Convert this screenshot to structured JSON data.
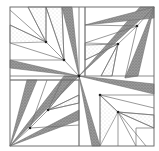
{
  "figure": {
    "width": 159,
    "height": 151,
    "background": "#ffffff",
    "line_color": "#6f6f6f",
    "dark_fill": "#8c8c8c",
    "light_fill": "#d9d9d9",
    "dot_color": "#222222",
    "outer": {
      "x": 10,
      "y": 7,
      "w": 144,
      "h": 139
    },
    "center": {
      "x": 79,
      "y": 76
    }
  },
  "quadrants": [
    {
      "name": "top-left",
      "dark": [
        [
          [
            62,
            7
          ],
          [
            79,
            76
          ],
          [
            72,
            7
          ]
        ],
        [
          [
            10,
            60
          ],
          [
            79,
            76
          ],
          [
            10,
            68
          ]
        ]
      ],
      "spokes": [
        [
          [
            10,
            10
          ],
          [
            46,
            42
          ]
        ],
        [
          [
            28,
            7
          ],
          [
            46,
            42
          ]
        ],
        [
          [
            46,
            7
          ],
          [
            46,
            42
          ]
        ],
        [
          [
            10,
            25
          ],
          [
            46,
            42
          ]
        ],
        [
          [
            10,
            43
          ],
          [
            64,
            60
          ]
        ],
        [
          [
            46,
            7
          ],
          [
            64,
            60
          ]
        ],
        [
          [
            62,
            7
          ],
          [
            64,
            60
          ]
        ],
        [
          [
            46,
            42
          ],
          [
            64,
            60
          ]
        ],
        [
          [
            10,
            60
          ],
          [
            64,
            60
          ]
        ],
        [
          [
            64,
            60
          ],
          [
            79,
            76
          ]
        ]
      ],
      "light": [
        [
          [
            28,
            7
          ],
          [
            46,
            42
          ],
          [
            46,
            7
          ]
        ],
        [
          [
            46,
            7
          ],
          [
            64,
            60
          ],
          [
            62,
            7
          ]
        ],
        [
          [
            10,
            25
          ],
          [
            46,
            42
          ],
          [
            10,
            43
          ]
        ]
      ],
      "dots": [
        [
          46,
          42
        ],
        [
          64,
          60
        ]
      ]
    },
    {
      "name": "top-right",
      "dark": [
        [
          [
            154,
            7
          ],
          [
            79,
            76
          ],
          [
            140,
            7
          ]
        ],
        [
          [
            154,
            7
          ],
          [
            85,
            25
          ],
          [
            154,
            18
          ]
        ],
        [
          [
            154,
            7
          ],
          [
            125,
            78
          ],
          [
            138,
            76
          ]
        ]
      ],
      "spokes": [
        [
          [
            154,
            7
          ],
          [
            137,
            26
          ]
        ],
        [
          [
            137,
            26
          ],
          [
            85,
            25
          ]
        ],
        [
          [
            137,
            26
          ],
          [
            85,
            43
          ]
        ],
        [
          [
            137,
            26
          ],
          [
            118,
            44
          ]
        ],
        [
          [
            118,
            44
          ],
          [
            85,
            45
          ]
        ],
        [
          [
            118,
            44
          ],
          [
            85,
            60
          ]
        ],
        [
          [
            118,
            44
          ],
          [
            101,
            76
          ]
        ],
        [
          [
            118,
            44
          ],
          [
            112,
            76
          ]
        ],
        [
          [
            85,
            7
          ],
          [
            85,
            76
          ]
        ],
        [
          [
            137,
            26
          ],
          [
            125,
            78
          ]
        ]
      ],
      "light": [
        [
          [
            85,
            43
          ],
          [
            118,
            44
          ],
          [
            85,
            60
          ]
        ],
        [
          [
            118,
            44
          ],
          [
            101,
            76
          ],
          [
            112,
            76
          ]
        ]
      ],
      "dots": [
        [
          137,
          26
        ],
        [
          118,
          44
        ]
      ]
    },
    {
      "name": "bottom-left",
      "dark": [
        [
          [
            10,
            146
          ],
          [
            27,
            80
          ],
          [
            37,
            80
          ]
        ],
        [
          [
            10,
            146
          ],
          [
            79,
            120
          ],
          [
            79,
            110
          ]
        ],
        [
          [
            10,
            146
          ],
          [
            79,
            76
          ],
          [
            64,
            76
          ]
        ]
      ],
      "spokes": [
        [
          [
            10,
            146
          ],
          [
            30,
            128
          ]
        ],
        [
          [
            30,
            128
          ],
          [
            47,
            80
          ]
        ],
        [
          [
            30,
            128
          ],
          [
            48,
            110
          ]
        ],
        [
          [
            30,
            128
          ],
          [
            79,
            125
          ]
        ],
        [
          [
            48,
            110
          ],
          [
            62,
            80
          ]
        ],
        [
          [
            48,
            110
          ],
          [
            72,
            80
          ]
        ],
        [
          [
            48,
            110
          ],
          [
            79,
            95
          ]
        ],
        [
          [
            48,
            110
          ],
          [
            79,
            103
          ]
        ],
        [
          [
            10,
            80
          ],
          [
            79,
            80
          ]
        ],
        [
          [
            79,
            80
          ],
          [
            79,
            146
          ]
        ]
      ],
      "light": [
        [
          [
            48,
            110
          ],
          [
            62,
            80
          ],
          [
            72,
            80
          ]
        ],
        [
          [
            48,
            110
          ],
          [
            79,
            95
          ],
          [
            79,
            103
          ]
        ]
      ],
      "dots": [
        [
          30,
          128
        ],
        [
          48,
          110
        ]
      ]
    },
    {
      "name": "bottom-right",
      "dark": [
        [
          [
            79,
            76
          ],
          [
            154,
            94
          ],
          [
            154,
            84
          ]
        ],
        [
          [
            79,
            76
          ],
          [
            100,
            146
          ],
          [
            92,
            146
          ]
        ]
      ],
      "spokes": [
        [
          [
            100,
            95
          ],
          [
            154,
            95
          ]
        ],
        [
          [
            100,
            95
          ],
          [
            154,
            108
          ]
        ],
        [
          [
            100,
            95
          ],
          [
            118,
            112
          ]
        ],
        [
          [
            118,
            112
          ],
          [
            154,
            115
          ]
        ],
        [
          [
            118,
            112
          ],
          [
            154,
            128
          ]
        ],
        [
          [
            118,
            112
          ],
          [
            136,
            146
          ]
        ],
        [
          [
            118,
            112
          ],
          [
            146,
            146
          ]
        ],
        [
          [
            100,
            95
          ],
          [
            100,
            146
          ]
        ],
        [
          [
            118,
            112
          ],
          [
            118,
            146
          ]
        ],
        [
          [
            136,
            128
          ],
          [
            136,
            146
          ]
        ],
        [
          [
            136,
            128
          ],
          [
            154,
            128
          ]
        ]
      ],
      "light": [
        [
          [
            100,
            95
          ],
          [
            118,
            112
          ],
          [
            100,
            146
          ]
        ],
        [
          [
            118,
            112
          ],
          [
            154,
            115
          ],
          [
            154,
            128
          ]
        ]
      ],
      "dots": [
        [
          100,
          95
        ],
        [
          118,
          112
        ]
      ]
    }
  ],
  "grid_lines": [
    [
      [
        79,
        7
      ],
      [
        79,
        146
      ]
    ],
    [
      [
        10,
        76
      ],
      [
        154,
        76
      ]
    ],
    [
      [
        10,
        80
      ],
      [
        79,
        80
      ]
    ],
    [
      [
        85,
        7
      ],
      [
        85,
        76
      ]
    ]
  ]
}
